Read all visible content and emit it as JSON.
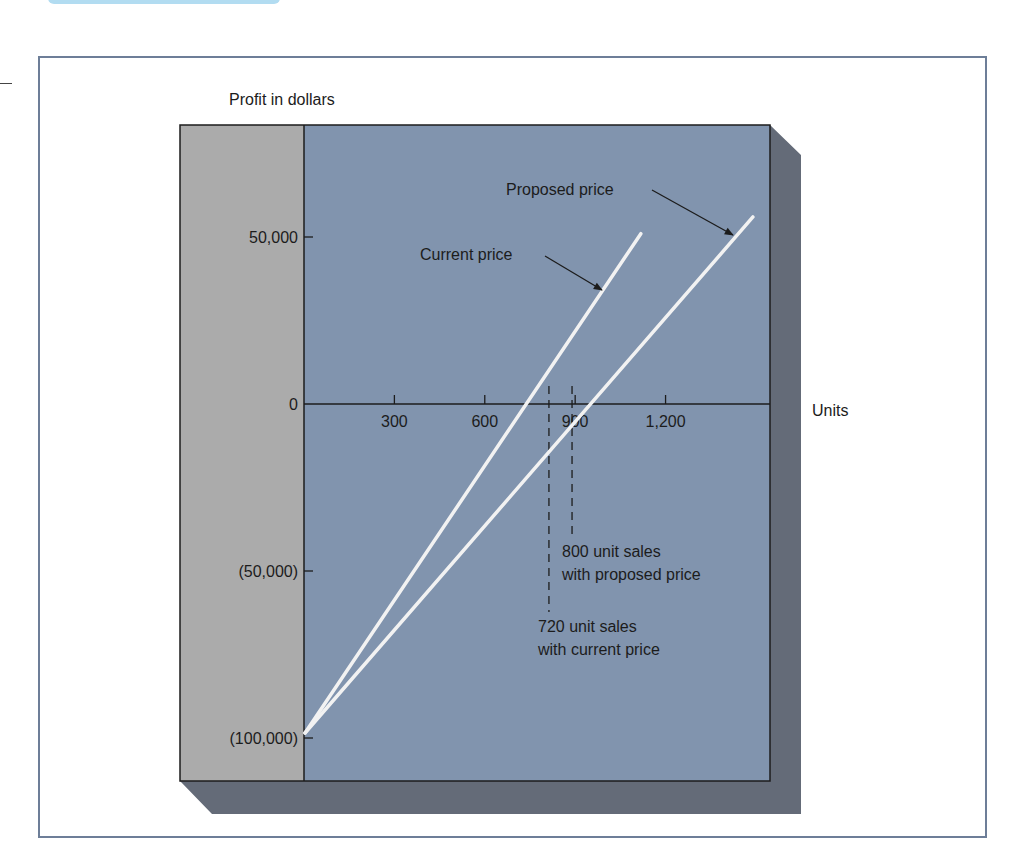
{
  "chart_data": {
    "type": "line",
    "title": "",
    "ylabel": "Profit in dollars",
    "xlabel": "Units",
    "xlim": [
      0,
      1540
    ],
    "ylim": [
      -115000,
      83000
    ],
    "x_ticks": [
      300,
      600,
      900,
      1200
    ],
    "x_tick_labels": [
      "300",
      "600",
      "900",
      "1,200"
    ],
    "y_ticks": [
      50000,
      0,
      -50000,
      -100000
    ],
    "y_tick_labels": [
      "50,000",
      "0",
      "(50,000)",
      "(100,000)"
    ],
    "grid": false,
    "legend": "none (inline arrow annotations)",
    "series": [
      {
        "name": "Current price",
        "x": [
          0,
          720,
          1118
        ],
        "y": [
          -100000,
          0,
          51000
        ],
        "break_even_units": 720
      },
      {
        "name": "Proposed price",
        "x": [
          0,
          800,
          1490
        ],
        "y": [
          -100000,
          0,
          56000
        ],
        "break_even_units": 800
      }
    ],
    "annotations": [
      {
        "text": "Current price",
        "arrow_to_series": "Current price"
      },
      {
        "text": "Proposed price",
        "arrow_to_series": "Proposed price"
      },
      {
        "text_lines": [
          "800 unit sales",
          "with proposed price"
        ],
        "marker_x": 800,
        "style": "dashed vertical"
      },
      {
        "text_lines": [
          "720 unit sales",
          "with current price"
        ],
        "marker_x": 720,
        "style": "dashed vertical"
      }
    ]
  },
  "labels": {
    "y_axis_title": "Profit in dollars",
    "x_axis_title": "Units",
    "current_price": "Current price",
    "proposed_price": "Proposed price",
    "proposed_note_1": "800 unit sales",
    "proposed_note_2": "with proposed price",
    "current_note_1": "720 unit sales",
    "current_note_2": "with current price"
  },
  "colors": {
    "plot_area": "#8194ae",
    "left_panel": "#ababab",
    "shadow": "#646b78",
    "frame": "#6d7e98",
    "series_line": "#f2f2f2",
    "ink": "#1c1c1c"
  }
}
